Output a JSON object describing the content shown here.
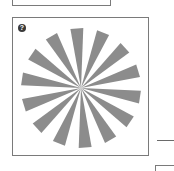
{
  "top_card": {
    "label": ""
  },
  "image_card": {
    "help_icon": "question-circle-icon",
    "help_glyph": "?",
    "image": {
      "kind": "siemens-star",
      "wedge_count": 14,
      "wedge_color": "#8c8c8c",
      "center": [
        68,
        70
      ],
      "radius": 60
    }
  },
  "colors": {
    "border": "#7a7a7a",
    "icon_bg": "#3a3a3a",
    "background": "#ffffff"
  }
}
